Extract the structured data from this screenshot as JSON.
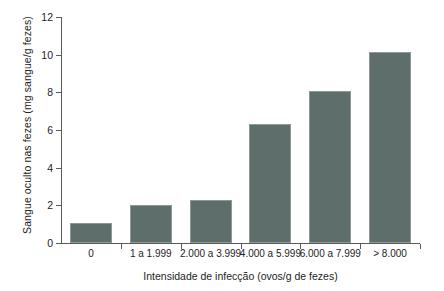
{
  "chart_data": {
    "type": "bar",
    "title": "",
    "xlabel": "Intensidade de infecção (ovos/g de fezes)",
    "ylabel": "Sangue oculto nas fezes (mg sangue/g fezes)",
    "categories": [
      "0",
      "1 a 1.999",
      "2.000 a 3.999",
      "4.000 a 5.999",
      "6.000 a 7.999",
      "> 8.000"
    ],
    "values": [
      1.05,
      2.0,
      2.3,
      6.3,
      8.05,
      10.15
    ],
    "ylim": [
      0,
      12
    ],
    "yticks": [
      0,
      2,
      4,
      6,
      8,
      10,
      12
    ],
    "yticklabels": [
      "0",
      "2",
      "4",
      "6",
      "8",
      "10",
      "12"
    ],
    "grid": false,
    "legend": null,
    "bar_color": "#5e6e6b",
    "axis_color": "#5a5a5a"
  }
}
